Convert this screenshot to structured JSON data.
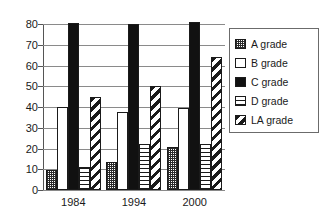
{
  "chart_data": {
    "type": "bar",
    "title": "",
    "xlabel": "",
    "ylabel": "",
    "categories": [
      "1984",
      "1994",
      "2000"
    ],
    "ylim": [
      0,
      80
    ],
    "yticks": [
      0,
      10,
      20,
      30,
      40,
      50,
      60,
      70,
      80
    ],
    "grid": true,
    "legend_position": "right",
    "series": [
      {
        "name": "A grade",
        "pattern": "checkered-gray",
        "values": [
          9.5,
          13.5,
          20.5
        ]
      },
      {
        "name": "B grade",
        "pattern": "white-empty",
        "values": [
          40,
          37.5,
          39.5
        ]
      },
      {
        "name": "C grade",
        "pattern": "solid-black",
        "values": [
          80.5,
          80,
          81
        ]
      },
      {
        "name": "D grade",
        "pattern": "horizontal-stripes",
        "values": [
          11,
          22,
          22
        ]
      },
      {
        "name": "LA grade",
        "pattern": "diagonal-stripes",
        "values": [
          45,
          50,
          64
        ]
      }
    ]
  },
  "legend": {
    "items": [
      {
        "label": "A grade"
      },
      {
        "label": "B grade"
      },
      {
        "label": "C grade"
      },
      {
        "label": "D grade"
      },
      {
        "label": "LA grade"
      }
    ]
  },
  "axis": {
    "y_tick_labels": [
      "80",
      "70",
      "60",
      "50",
      "40",
      "30",
      "20",
      "10",
      "0"
    ],
    "x_tick_labels": [
      "1984",
      "1994",
      "2000"
    ]
  },
  "colors": {
    "ink": "#1a1a1a",
    "grid": "#8a8a8a",
    "axis": "#555555",
    "background": "#ffffff"
  }
}
